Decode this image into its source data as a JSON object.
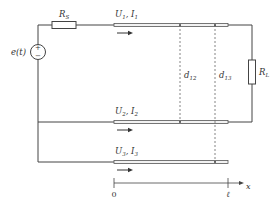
{
  "diagram": {
    "type": "multiconductor transmission line circuit",
    "source": {
      "label": "e(t)",
      "plus": "+",
      "minus": "−"
    },
    "resistors": {
      "source": {
        "label": "R",
        "sub": "S"
      },
      "load": {
        "label": "R",
        "sub": "L"
      }
    },
    "conductors": [
      {
        "id": 1,
        "label": "U",
        "sub": "1",
        "label2": "I",
        "sub2": "1"
      },
      {
        "id": 2,
        "label": "U",
        "sub": "2",
        "label2": "I",
        "sub2": "2"
      },
      {
        "id": 3,
        "label": "U",
        "sub": "3",
        "label2": "I",
        "sub2": "3"
      }
    ],
    "distances": [
      {
        "label": "d",
        "sub": "12"
      },
      {
        "label": "d",
        "sub": "13"
      }
    ],
    "axis": {
      "label": "x",
      "start": "0",
      "end": "ℓ"
    },
    "colors": {
      "stroke": "#444444",
      "conductor_fill": "#f2f2f2",
      "background": "#ffffff"
    }
  }
}
